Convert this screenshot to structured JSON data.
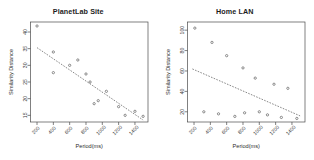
{
  "figure": {
    "background": "#ffffff",
    "panel_count": 2,
    "point_symbol": "open-circle",
    "fit_line_style": "dashed",
    "line_color": "#555555",
    "point_color": "#555555",
    "axis_color": "#4a4a4a"
  },
  "chart_data": [
    {
      "type": "scatter",
      "title": "PlanetLab Site",
      "xlabel": "Period(ms)",
      "ylabel": "Similarity Distance",
      "xlim": [
        120,
        1560
      ],
      "ylim": [
        13,
        43
      ],
      "xticks": [
        200,
        400,
        600,
        800,
        1000,
        1200,
        1400
      ],
      "xticklabels": [
        "200",
        "400",
        "600",
        "800",
        "1000",
        "1200",
        "1400"
      ],
      "yticks": [
        15,
        20,
        25,
        30,
        35,
        40
      ],
      "yticklabels": [
        "15",
        "20",
        "25",
        "30",
        "35",
        "40"
      ],
      "grid": false,
      "legend": "none",
      "points": [
        {
          "x": 200,
          "y": 41.8
        },
        {
          "x": 400,
          "y": 34.0
        },
        {
          "x": 400,
          "y": 27.8
        },
        {
          "x": 600,
          "y": 30.0
        },
        {
          "x": 700,
          "y": 31.6
        },
        {
          "x": 800,
          "y": 27.4
        },
        {
          "x": 850,
          "y": 25.0
        },
        {
          "x": 900,
          "y": 18.5
        },
        {
          "x": 950,
          "y": 19.4
        },
        {
          "x": 1050,
          "y": 22.2
        },
        {
          "x": 1200,
          "y": 17.6
        },
        {
          "x": 1280,
          "y": 15.0
        },
        {
          "x": 1400,
          "y": 16.2
        },
        {
          "x": 1500,
          "y": 14.7
        }
      ],
      "fit_line": {
        "x0": 200,
        "y0": 35.3,
        "x1": 1500,
        "y1": 13.6
      }
    },
    {
      "type": "scatter",
      "title": "Home LAN",
      "xlabel": "Period(ms)",
      "ylabel": "Similarity Distance",
      "xlim": [
        120,
        1560
      ],
      "ylim": [
        10,
        108
      ],
      "xticks": [
        200,
        400,
        600,
        800,
        1000,
        1200,
        1400
      ],
      "xticklabels": [
        "200",
        "400",
        "600",
        "800",
        "1000",
        "1200",
        "1400"
      ],
      "yticks": [
        20,
        40,
        60,
        80,
        100
      ],
      "yticklabels": [
        "20",
        "40",
        "60",
        "80",
        "100"
      ],
      "grid": false,
      "legend": "none",
      "points": [
        {
          "x": 210,
          "y": 102.0
        },
        {
          "x": 420,
          "y": 88.0
        },
        {
          "x": 600,
          "y": 75.0
        },
        {
          "x": 800,
          "y": 63.0
        },
        {
          "x": 950,
          "y": 53.0
        },
        {
          "x": 1180,
          "y": 47.0
        },
        {
          "x": 1350,
          "y": 43.0
        },
        {
          "x": 320,
          "y": 20.0
        },
        {
          "x": 500,
          "y": 18.0
        },
        {
          "x": 700,
          "y": 15.5
        },
        {
          "x": 820,
          "y": 19.0
        },
        {
          "x": 1000,
          "y": 20.0
        },
        {
          "x": 1100,
          "y": 17.0
        },
        {
          "x": 1270,
          "y": 14.5
        },
        {
          "x": 1460,
          "y": 13.5
        }
      ],
      "fit_line": {
        "x0": 180,
        "y0": 62.0,
        "x1": 1500,
        "y1": 16.0
      }
    }
  ]
}
